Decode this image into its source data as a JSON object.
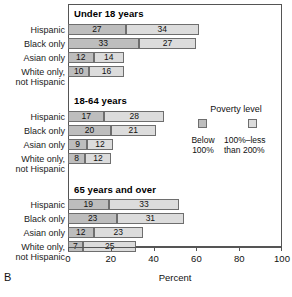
{
  "figure": {
    "panel_letter": "B",
    "xlabel": "Percent"
  },
  "legend": {
    "title": "Poverty level",
    "entries": [
      {
        "label": "Below\n100%",
        "line1": "Below",
        "line2": "100%",
        "color": "#bdbdbd"
      },
      {
        "label": "100%–less\nthan 200%",
        "line1": "100%–less",
        "line2": "than 200%",
        "color": "#dcdcdc"
      }
    ]
  },
  "axis": {
    "ticks": [
      "0",
      "20",
      "40",
      "60",
      "80",
      "100"
    ],
    "min": 0,
    "max": 100
  },
  "groups": [
    {
      "line1": "Hispanic",
      "line2": ""
    },
    {
      "line1": "Black only",
      "line2": ""
    },
    {
      "line1": "Asian only",
      "line2": ""
    },
    {
      "line1": "White only,",
      "line2": "not Hispanic"
    }
  ],
  "chart_data": {
    "type": "bar",
    "orientation": "horizontal",
    "stacked": true,
    "title": "",
    "xlabel": "Percent",
    "ylabel": "",
    "xlim": [
      0,
      100
    ],
    "grid": false,
    "legend_position": "right-middle",
    "legend_title": "Poverty level",
    "series": [
      {
        "name": "Below 100%",
        "color": "#bdbdbd"
      },
      {
        "name": "100%–less than 200%",
        "color": "#dcdcdc"
      }
    ],
    "panels": [
      {
        "title": "Under 18 years",
        "categories": [
          "Hispanic",
          "Black only",
          "Asian only",
          "White only, not Hispanic"
        ],
        "values": [
          [
            27,
            34
          ],
          [
            33,
            27
          ],
          [
            12,
            14
          ],
          [
            10,
            16
          ]
        ]
      },
      {
        "title": "18-64 years",
        "categories": [
          "Hispanic",
          "Black only",
          "Asian only",
          "White only, not Hispanic"
        ],
        "values": [
          [
            17,
            28
          ],
          [
            20,
            21
          ],
          [
            9,
            12
          ],
          [
            8,
            12
          ]
        ]
      },
      {
        "title": "65 years and over",
        "categories": [
          "Hispanic",
          "Black only",
          "Asian only",
          "White only, not Hispanic"
        ],
        "values": [
          [
            19,
            33
          ],
          [
            23,
            31
          ],
          [
            12,
            23
          ],
          [
            7,
            25
          ]
        ]
      }
    ]
  }
}
